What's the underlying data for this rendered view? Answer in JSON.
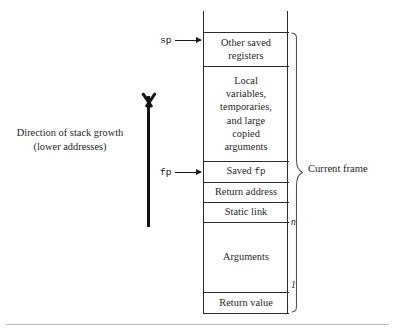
{
  "figure": {
    "type": "stack-frame-diagram",
    "background": "#ffffff",
    "line_color": "#2b2b2b",
    "rule_color": "#b9b9b9"
  },
  "stack": {
    "cells": [
      {
        "id": "other-saved-registers",
        "lines": [
          "Other saved",
          "registers"
        ],
        "text": "Other saved registers"
      },
      {
        "id": "locals",
        "lines": [
          "Local",
          "variables,",
          "temporaries,",
          "and large",
          "copied",
          "arguments"
        ],
        "text": "Local variables, temporaries, and large copied arguments"
      },
      {
        "id": "saved-fp",
        "prefix": "Saved ",
        "mono": "fp",
        "text": "Saved fp"
      },
      {
        "id": "return-address",
        "text": "Return address"
      },
      {
        "id": "static-link",
        "text": "Static link"
      },
      {
        "id": "arguments",
        "text": "Arguments"
      },
      {
        "id": "return-value",
        "text": "Return value"
      }
    ]
  },
  "pointers": [
    {
      "id": "sp",
      "label": "sp",
      "target_cell": "other-saved-registers"
    },
    {
      "id": "fp",
      "label": "fp",
      "target_cell": "saved-fp"
    }
  ],
  "annotations": {
    "growth_caption_line1": "Direction of stack growth",
    "growth_caption_line2": "(lower addresses)",
    "frame_label": "Current frame",
    "arg_top_index": "n",
    "arg_bottom_index": "1"
  }
}
